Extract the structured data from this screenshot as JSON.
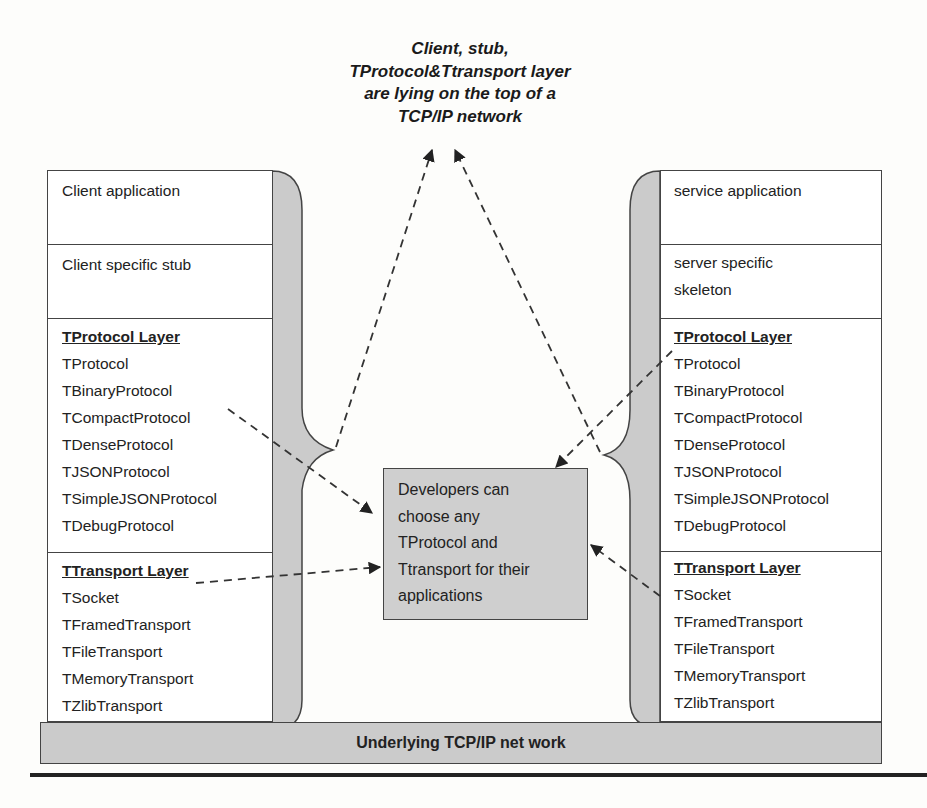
{
  "diagram": {
    "title_lines": [
      "Client, stub,",
      "TProtocol&Ttransport layer",
      "are lying on the top of a",
      "TCP/IP network"
    ],
    "client_stack": {
      "application": "Client application",
      "stub": "Client specific stub",
      "protocol_layer": {
        "header": "TProtocol Layer",
        "items": [
          "TProtocol",
          "TBinaryProtocol",
          "TCompactProtocol",
          "TDenseProtocol",
          "TJSONProtocol",
          "TSimpleJSONProtocol",
          "TDebugProtocol"
        ]
      },
      "transport_layer": {
        "header": "TTransport Layer",
        "items": [
          "TSocket",
          "TFramedTransport",
          "TFileTransport",
          "TMemoryTransport",
          "TZlibTransport"
        ]
      }
    },
    "server_stack": {
      "application": "service application",
      "skeleton_lines": [
        "server specific",
        "skeleton"
      ],
      "protocol_layer": {
        "header": "TProtocol Layer",
        "items": [
          "TProtocol",
          "TBinaryProtocol",
          "TCompactProtocol",
          "TDenseProtocol",
          "TJSONProtocol",
          "TSimpleJSONProtocol",
          "TDebugProtocol"
        ]
      },
      "transport_layer": {
        "header": "TTransport Layer",
        "items": [
          "TSocket",
          "TFramedTransport",
          "TFileTransport",
          "TMemoryTransport",
          "TZlibTransport"
        ]
      }
    },
    "center_note_lines": [
      "Developers can",
      "choose any",
      "TProtocol and",
      "Ttransport for their",
      "applications"
    ],
    "base_layer": "Underlying TCP/IP net work",
    "colors": {
      "shade": "#cbcbcb",
      "border": "#444444",
      "text": "#222222"
    }
  }
}
